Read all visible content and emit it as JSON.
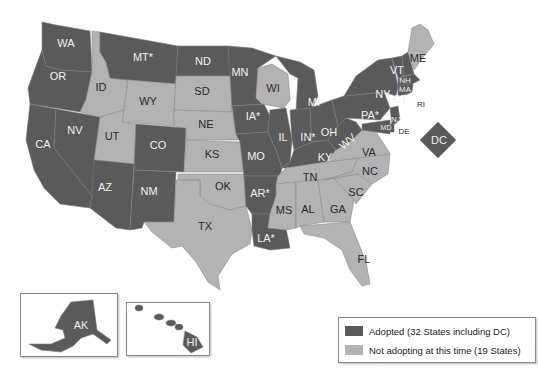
{
  "map": {
    "colors": {
      "adopted": "#5a5a5a",
      "not_adopted": "#b3b3b3"
    },
    "states": {
      "WA": {
        "label": "WA",
        "status": "adopted"
      },
      "OR": {
        "label": "OR",
        "status": "adopted"
      },
      "CA": {
        "label": "CA",
        "status": "adopted"
      },
      "NV": {
        "label": "NV",
        "status": "adopted"
      },
      "ID": {
        "label": "ID",
        "status": "not"
      },
      "MT": {
        "label": "MT*",
        "status": "adopted"
      },
      "WY": {
        "label": "WY",
        "status": "not"
      },
      "UT": {
        "label": "UT",
        "status": "not"
      },
      "AZ": {
        "label": "AZ",
        "status": "adopted"
      },
      "CO": {
        "label": "CO",
        "status": "adopted"
      },
      "NM": {
        "label": "NM",
        "status": "adopted"
      },
      "ND": {
        "label": "ND",
        "status": "adopted"
      },
      "SD": {
        "label": "SD",
        "status": "not"
      },
      "NE": {
        "label": "NE",
        "status": "not"
      },
      "KS": {
        "label": "KS",
        "status": "not"
      },
      "OK": {
        "label": "OK",
        "status": "not"
      },
      "TX": {
        "label": "TX",
        "status": "not"
      },
      "MN": {
        "label": "MN",
        "status": "adopted"
      },
      "IA": {
        "label": "IA*",
        "status": "adopted"
      },
      "MO": {
        "label": "MO",
        "status": "adopted"
      },
      "AR": {
        "label": "AR*",
        "status": "adopted"
      },
      "LA": {
        "label": "LA*",
        "status": "adopted"
      },
      "WI": {
        "label": "WI",
        "status": "not"
      },
      "IL": {
        "label": "IL",
        "status": "adopted"
      },
      "MI": {
        "label": "MI*",
        "status": "adopted"
      },
      "IN": {
        "label": "IN*",
        "status": "adopted"
      },
      "OH": {
        "label": "OH",
        "status": "adopted"
      },
      "KY": {
        "label": "KY",
        "status": "adopted"
      },
      "TN": {
        "label": "TN",
        "status": "not"
      },
      "MS": {
        "label": "MS",
        "status": "not"
      },
      "AL": {
        "label": "AL",
        "status": "not"
      },
      "GA": {
        "label": "GA",
        "status": "not"
      },
      "FL": {
        "label": "FL",
        "status": "not"
      },
      "SC": {
        "label": "SC",
        "status": "not"
      },
      "NC": {
        "label": "NC",
        "status": "not"
      },
      "VA": {
        "label": "VA",
        "status": "not"
      },
      "WV": {
        "label": "WV",
        "status": "adopted"
      },
      "PA": {
        "label": "PA*",
        "status": "adopted"
      },
      "NY": {
        "label": "NY",
        "status": "adopted"
      },
      "VT": {
        "label": "VT",
        "status": "adopted"
      },
      "NH": {
        "label": "NH",
        "status": "adopted"
      },
      "MA": {
        "label": "MA",
        "status": "adopted"
      },
      "CT": {
        "label": "CT",
        "status": "adopted"
      },
      "RI": {
        "label": "RI",
        "status": "adopted"
      },
      "NJ": {
        "label": "NJ",
        "status": "adopted"
      },
      "DE": {
        "label": "DE",
        "status": "adopted"
      },
      "MD": {
        "label": "MD",
        "status": "adopted"
      },
      "ME": {
        "label": "ME",
        "status": "not"
      },
      "DC": {
        "label": "DC",
        "status": "adopted"
      },
      "AK": {
        "label": "AK",
        "status": "adopted"
      },
      "HI": {
        "label": "HI",
        "status": "adopted"
      }
    }
  },
  "legend": {
    "adopted": "Adopted (32 States including DC)",
    "not_adopted": "Not adopting at this time (19 States)"
  }
}
